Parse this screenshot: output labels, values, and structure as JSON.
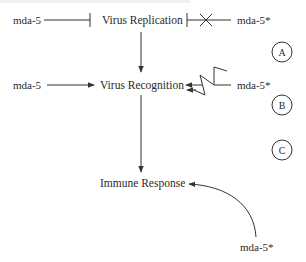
{
  "diagram": {
    "nodes": {
      "virus_replication": "Virus Replication",
      "virus_recognition": "Virus Recognition",
      "immune_response": "Immune Response"
    },
    "agents": {
      "a_left": "mda-5",
      "a_right": "mda-5*",
      "b_left": "mda-5",
      "b_right": "mda-5*",
      "c_bottom": "mda-5*"
    },
    "panels": [
      "A",
      "B",
      "C"
    ],
    "edges": [
      {
        "from": "mda-5",
        "to": "Virus Replication",
        "type": "inhibition",
        "panel": "A"
      },
      {
        "from": "mda-5*",
        "to": "Virus Replication",
        "type": "inhibition-blocked",
        "panel": "A"
      },
      {
        "from": "Virus Replication",
        "to": "Virus Recognition",
        "type": "activation"
      },
      {
        "from": "mda-5",
        "to": "Virus Recognition",
        "type": "activation",
        "panel": "B"
      },
      {
        "from": "mda-5*",
        "to": "Virus Recognition",
        "type": "activation-disrupted",
        "panel": "B"
      },
      {
        "from": "Virus Recognition",
        "to": "Immune Response",
        "type": "activation"
      },
      {
        "from": "mda-5*",
        "to": "Immune Response",
        "type": "activation-curved",
        "panel": "C"
      }
    ],
    "colors": {
      "line": "#333333",
      "text": "#2a2a2a",
      "background": "#ffffff"
    }
  }
}
